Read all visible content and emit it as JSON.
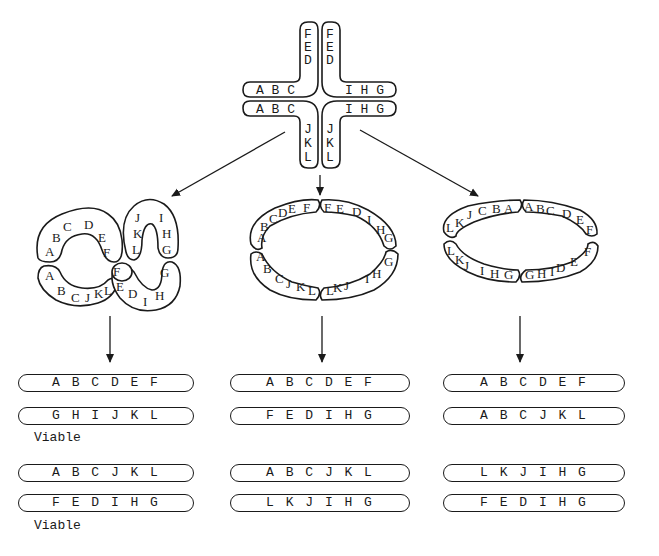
{
  "pachytene_cross": {
    "arms": {
      "top_left": "FED",
      "top_right": "FED",
      "left_upper": "ABC",
      "left_lower": "ABC",
      "right_upper": "IHG",
      "right_lower": "IHG",
      "bottom_left": "JKL",
      "bottom_right": "JKL"
    }
  },
  "configurations": [
    {
      "name": "figure-eight",
      "ring_labels": {
        "left_upper": [
          "A",
          "B",
          "C",
          "D",
          "E",
          "F"
        ],
        "left_lower": [
          "A",
          "B",
          "C",
          "J",
          "K",
          "L"
        ],
        "right_upper": [
          "L",
          "K",
          "J",
          "I",
          "H",
          "G"
        ],
        "right_lower": [
          "F",
          "E",
          "D",
          "I",
          "H",
          "G"
        ]
      },
      "products": [
        {
          "chromosomes": [
            "A B C D E F",
            "G H I J K L"
          ],
          "label": "Viable"
        },
        {
          "chromosomes": [
            "A B C J K L",
            "F E D I H G"
          ],
          "label": "Viable"
        }
      ]
    },
    {
      "name": "ring-adjacent-1",
      "ring_labels": {
        "top_left": "ABCDEF",
        "top_right": "FEDIHG",
        "bottom_left": "ABCJKL",
        "bottom_right": "LKJIHG"
      },
      "products": [
        {
          "chromosomes": [
            "A B C D E F",
            "F E D I H G"
          ],
          "label": ""
        },
        {
          "chromosomes": [
            "A B C J K L",
            "L K J I H G"
          ],
          "label": ""
        }
      ]
    },
    {
      "name": "ring-adjacent-2",
      "ring_labels": {
        "top_left": "LKJCBA",
        "top_right": "ABCDEF",
        "bottom_left": "LKJIHG",
        "bottom_right": "GHIDEF"
      },
      "products": [
        {
          "chromosomes": [
            "A B C D E F",
            "A B C J K L"
          ],
          "label": ""
        },
        {
          "chromosomes": [
            "L K J I H G",
            "F E D I H G"
          ],
          "label": ""
        }
      ]
    }
  ],
  "colors": {
    "ink": "#1a1a1a",
    "background": "#ffffff"
  }
}
